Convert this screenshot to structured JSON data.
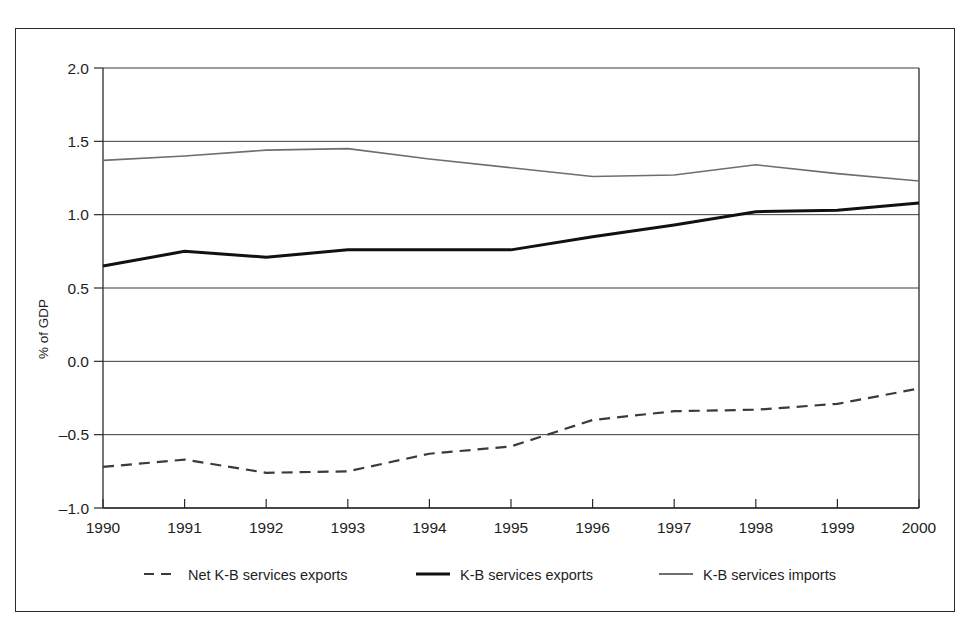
{
  "chart_data": {
    "type": "line",
    "title": "",
    "xlabel": "",
    "ylabel": "% of GDP",
    "x": [
      1990,
      1991,
      1992,
      1993,
      1994,
      1995,
      1996,
      1997,
      1998,
      1999,
      2000
    ],
    "categories": [
      "1990",
      "1991",
      "1992",
      "1993",
      "1994",
      "1995",
      "1996",
      "1997",
      "1998",
      "1999",
      "2000"
    ],
    "ylim": [
      -1.0,
      2.0
    ],
    "yticks": [
      2.0,
      1.5,
      1.0,
      0.5,
      0.0,
      -0.5,
      -1.0
    ],
    "ytick_labels": [
      "2.0",
      "1.5",
      "1.0",
      "0.5",
      "0.0",
      "–0.5",
      "–1.0"
    ],
    "grid": true,
    "grid_axis": "y",
    "legend_position": "bottom",
    "series": [
      {
        "name": "Net K-B services exports",
        "style": "dashed",
        "color": "#3b3b3b",
        "width": 2.2,
        "values": [
          -0.72,
          -0.67,
          -0.76,
          -0.75,
          -0.63,
          -0.58,
          -0.4,
          -0.34,
          -0.33,
          -0.29,
          -0.185
        ]
      },
      {
        "name": "K-B services exports",
        "style": "solid-thick",
        "color": "#111111",
        "width": 3.0,
        "values": [
          0.65,
          0.75,
          0.71,
          0.76,
          0.76,
          0.76,
          0.85,
          0.93,
          1.02,
          1.03,
          1.08
        ]
      },
      {
        "name": "K-B services imports",
        "style": "solid-thin",
        "color": "#6e6e6e",
        "width": 1.6,
        "values": [
          1.37,
          1.4,
          1.44,
          1.45,
          1.38,
          1.32,
          1.26,
          1.27,
          1.34,
          1.28,
          1.23
        ]
      }
    ]
  },
  "legend": {
    "items": [
      {
        "label": "Net K-B services exports",
        "marker": "dashed-line-marker"
      },
      {
        "label": "K-B services exports",
        "marker": "thick-solid-line-marker"
      },
      {
        "label": "K-B services imports",
        "marker": "thin-solid-line-marker"
      }
    ]
  },
  "axes": {
    "y_title": "% of GDP"
  },
  "colors": {
    "frame": "#2b2b2b",
    "grid": "#3a3a3a",
    "net_exports": "#3b3b3b",
    "exports": "#111111",
    "imports": "#6e6e6e",
    "background": "#ffffff"
  }
}
